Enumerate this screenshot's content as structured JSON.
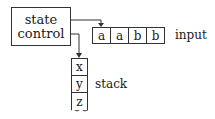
{
  "diagram": {
    "type": "pushdown-automaton",
    "state_control": {
      "line1": "state",
      "line2": "control"
    },
    "input": {
      "label": "input",
      "cells": [
        "a",
        "a",
        "b",
        "b"
      ],
      "head_position": 0
    },
    "stack": {
      "label": "stack",
      "cells": [
        "x",
        "y",
        "z"
      ],
      "bottom_style": "wavy-open"
    },
    "edges": [
      {
        "from": "state_control",
        "to": "input.cells.0",
        "style": "arrow"
      },
      {
        "from": "state_control",
        "to": "stack.cells.0",
        "style": "arrow"
      }
    ],
    "colors": {
      "stroke": "#333333",
      "text": "#1a1a1a",
      "background": "#ffffff"
    }
  }
}
